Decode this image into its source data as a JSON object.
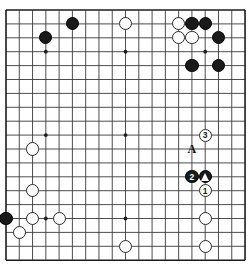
{
  "board": {
    "kind": "go-board",
    "size": 19,
    "geometry": {
      "left": 6,
      "top": 10,
      "spacing": 13.28,
      "v_spacing": 13.9,
      "stone_radius": 6.6,
      "line_color": "#3a3a3a",
      "edge_line_color": "#1c1c1c",
      "background": "#ffffff"
    },
    "hoshi": [
      {
        "col": 4,
        "row": 4
      },
      {
        "col": 10,
        "row": 4
      },
      {
        "col": 16,
        "row": 4
      },
      {
        "col": 4,
        "row": 10
      },
      {
        "col": 10,
        "row": 10
      },
      {
        "col": 16,
        "row": 10
      },
      {
        "col": 4,
        "row": 16
      },
      {
        "col": 10,
        "row": 16
      },
      {
        "col": 16,
        "row": 16
      }
    ],
    "stones": [
      {
        "id": "b-f2",
        "color": "black",
        "col": 6,
        "row": 2,
        "label": "",
        "marker": ""
      },
      {
        "id": "b-d3",
        "color": "black",
        "col": 4,
        "row": 3,
        "label": "",
        "marker": ""
      },
      {
        "id": "w-k2",
        "color": "white",
        "col": 10,
        "row": 2,
        "label": "",
        "marker": ""
      },
      {
        "id": "w-o2",
        "color": "white",
        "col": 14,
        "row": 2,
        "label": "",
        "marker": ""
      },
      {
        "id": "b-p2",
        "color": "black",
        "col": 15,
        "row": 2,
        "label": "",
        "marker": ""
      },
      {
        "id": "b-q2",
        "color": "black",
        "col": 16,
        "row": 2,
        "label": "",
        "marker": ""
      },
      {
        "id": "w-o3",
        "color": "white",
        "col": 14,
        "row": 3,
        "label": "",
        "marker": ""
      },
      {
        "id": "w-p3",
        "color": "white",
        "col": 15,
        "row": 3,
        "label": "",
        "marker": ""
      },
      {
        "id": "b-r3",
        "color": "black",
        "col": 17,
        "row": 3,
        "label": "",
        "marker": ""
      },
      {
        "id": "b-p5",
        "color": "black",
        "col": 15,
        "row": 5,
        "label": "",
        "marker": ""
      },
      {
        "id": "b-r5",
        "color": "black",
        "col": 17,
        "row": 5,
        "label": "",
        "marker": ""
      },
      {
        "id": "w-c11",
        "color": "white",
        "col": 3,
        "row": 11,
        "label": "",
        "marker": ""
      },
      {
        "id": "w-q10",
        "color": "white",
        "col": 16,
        "row": 10,
        "label": "3",
        "marker": ""
      },
      {
        "id": "w-c14",
        "color": "white",
        "col": 3,
        "row": 14,
        "label": "",
        "marker": ""
      },
      {
        "id": "b-p13",
        "color": "black",
        "col": 15,
        "row": 13,
        "label": "2",
        "marker": ""
      },
      {
        "id": "b-q13",
        "color": "black",
        "col": 16,
        "row": 13,
        "label": "",
        "marker": "triangle"
      },
      {
        "id": "w-q14",
        "color": "white",
        "col": 16,
        "row": 14,
        "label": "1",
        "marker": ""
      },
      {
        "id": "b-a16",
        "color": "black",
        "col": 1,
        "row": 16,
        "label": "",
        "marker": ""
      },
      {
        "id": "w-c16",
        "color": "white",
        "col": 3,
        "row": 16,
        "label": "",
        "marker": ""
      },
      {
        "id": "w-e16",
        "color": "white",
        "col": 5,
        "row": 16,
        "label": "",
        "marker": ""
      },
      {
        "id": "w-b17",
        "color": "white",
        "col": 2,
        "row": 17,
        "label": "",
        "marker": ""
      },
      {
        "id": "w-q16",
        "color": "white",
        "col": 16,
        "row": 16,
        "label": "",
        "marker": ""
      },
      {
        "id": "w-k18",
        "color": "white",
        "col": 10,
        "row": 18,
        "label": "",
        "marker": ""
      },
      {
        "id": "w-q18",
        "color": "white",
        "col": 16,
        "row": 18,
        "label": "",
        "marker": ""
      }
    ],
    "letter_marks": [
      {
        "id": "mark-a",
        "text": "A",
        "col": 15,
        "row": 11
      }
    ]
  }
}
